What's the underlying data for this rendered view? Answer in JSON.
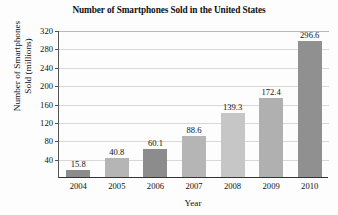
{
  "chart_data": {
    "type": "bar",
    "title": "Number of Smartphones Sold in the United States",
    "xlabel": "Year",
    "ylabel_line1": "Number of Smartphones",
    "ylabel_line2": "Sold (millions)",
    "categories": [
      "2004",
      "2005",
      "2006",
      "2007",
      "2008",
      "2009",
      "2010"
    ],
    "values": [
      15.8,
      40.8,
      60.1,
      88.6,
      139.3,
      172.4,
      296.6
    ],
    "value_labels": [
      "15.8",
      "40.8",
      "60.1",
      "88.6",
      "139.3",
      "172.4",
      "296.6"
    ],
    "bar_colors": [
      "#8c8c8c",
      "#b5b5b5",
      "#8c8c8c",
      "#b5b5b5",
      "#c6c6c6",
      "#b0b0b0",
      "#909090"
    ],
    "ylim": [
      0,
      320
    ],
    "yticks": [
      40,
      80,
      120,
      160,
      200,
      240,
      280,
      320
    ],
    "ytick_labels": [
      "40",
      "80",
      "120",
      "160",
      "200",
      "240",
      "280",
      "320"
    ],
    "grid": true,
    "legend": "none",
    "background_color": "#fdfdfd",
    "axis_color": "#333333",
    "gridline_color": "#d8d8d8"
  }
}
